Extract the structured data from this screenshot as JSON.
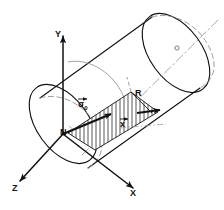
{
  "figure": {
    "type": "technical-line-diagram",
    "background_color": "#ffffff",
    "line_color": "#111111",
    "hidden_line_color": "#8a8a8a",
    "axis_dashdot_color": "#9a9a9a",
    "hatch_color": "#222222"
  },
  "labels": {
    "axis_y": "Y",
    "axis_x": "X",
    "axis_z": "Z",
    "origin": "N",
    "radius": "R",
    "stress_vector": "σ",
    "stress_vector_subscript": "0",
    "coordinate_xbar": "x"
  },
  "annotations": {
    "origin_point_name": "N",
    "radius_name": "R",
    "stress_vector_name": "sigma-zero-vector",
    "xbar_name": "x-bar-coordinate",
    "center_marker_name": "cylinder-axis-center-point"
  },
  "geometry": {
    "near_ellipse": {
      "cx": 63,
      "cy": 124,
      "rx": 28,
      "ry": 45,
      "rotation": -22
    },
    "far_ellipse": {
      "cx": 176,
      "cy": 57,
      "rx": 28,
      "ry": 45,
      "rotation": -22
    },
    "cylinder_axis": {
      "x1": 46,
      "y1": 139,
      "x2": 215,
      "y2": 22
    },
    "y_axis": {
      "x1": 63,
      "y1": 134,
      "x2": 63,
      "y2": 32
    },
    "x_axis": {
      "x1": 63,
      "y1": 134,
      "x2": 136,
      "y2": 190
    },
    "z_axis": {
      "x1": 63,
      "y1": 134,
      "x2": 17,
      "y2": 184
    }
  }
}
